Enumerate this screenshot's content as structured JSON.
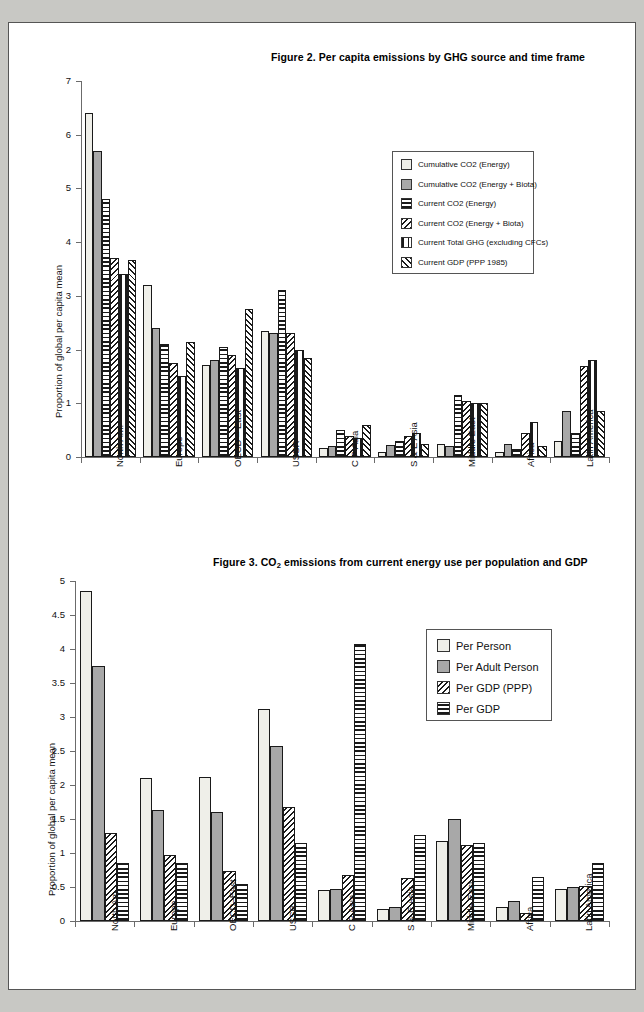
{
  "figures": [
    {
      "id": "figure-2",
      "title": "Figure 2. Per capita emissions by GHG source and time frame",
      "chart_data": {
        "type": "bar",
        "title": "Figure 2. Per capita emissions by GHG source and time frame",
        "xlabel": "",
        "ylabel": "Proportion of global per capita mean",
        "ylim": [
          0,
          7
        ],
        "yticks": [
          0,
          1,
          2,
          3,
          4,
          5,
          6,
          7
        ],
        "grid": false,
        "legend_position": "upper-right",
        "categories": [
          "North Am.",
          "Europe",
          "OECD – East",
          "USSR",
          "C P Asia",
          "S & E Asia",
          "Middle East",
          "Africa",
          "Latin America"
        ],
        "series": [
          {
            "name": "Cumulative CO2 (Energy)",
            "pattern": "dots",
            "values": [
              6.4,
              3.2,
              1.72,
              2.35,
              0.17,
              0.1,
              0.25,
              0.1,
              0.3
            ]
          },
          {
            "name": "Cumulative CO2 (Energy + Biota)",
            "pattern": "gray",
            "values": [
              5.7,
              2.4,
              1.8,
              2.3,
              0.2,
              0.22,
              0.2,
              0.25,
              0.85
            ]
          },
          {
            "name": "Current CO2  (Energy)",
            "pattern": "horizontal-lines",
            "values": [
              4.8,
              2.1,
              2.05,
              3.1,
              0.5,
              0.3,
              1.15,
              0.15,
              0.45
            ]
          },
          {
            "name": "Current CO2 (Energy + Biota)",
            "pattern": "back-diagonal",
            "values": [
              3.7,
              1.75,
              1.9,
              2.3,
              0.4,
              0.4,
              1.05,
              0.45,
              1.7
            ]
          },
          {
            "name": "Current Total GHG (excluding CFCs)",
            "pattern": "vertical-lines",
            "values": [
              3.4,
              1.5,
              1.65,
              2.0,
              0.35,
              0.45,
              1.0,
              0.65,
              1.8
            ]
          },
          {
            "name": "Current GDP (PPP 1985)",
            "pattern": "forward-diagonal",
            "values": [
              3.67,
              2.15,
              2.75,
              1.85,
              0.6,
              0.25,
              1.0,
              0.2,
              0.85
            ]
          }
        ]
      }
    },
    {
      "id": "figure-3",
      "title_prefix": "Figure 3. CO",
      "title_sub": "2",
      "title_suffix": " emissions from current energy use per population and GDP",
      "chart_data": {
        "type": "bar",
        "title": "Figure 3. CO2 emissions from current energy use per population and GDP",
        "xlabel": "",
        "ylabel": "Proportion of global per capita mean",
        "ylim": [
          0,
          5
        ],
        "yticks": [
          0,
          0.5,
          1,
          1.5,
          2,
          2.5,
          3,
          3.5,
          4,
          4.5,
          5
        ],
        "grid": false,
        "legend_position": "upper-right",
        "categories": [
          "North Am.",
          "Europe",
          "OECD–East",
          "USSR",
          "C P Asia",
          "S & E Asia",
          "Middle East",
          "Africa",
          "Latin America"
        ],
        "series": [
          {
            "name": "Per Person",
            "pattern": "dots",
            "values": [
              4.85,
              2.1,
              2.12,
              3.12,
              0.45,
              0.17,
              1.18,
              0.2,
              0.47
            ]
          },
          {
            "name": "Per Adult Person",
            "pattern": "gray",
            "values": [
              3.75,
              1.63,
              1.6,
              2.58,
              0.47,
              0.2,
              1.5,
              0.3,
              0.5
            ]
          },
          {
            "name": "Per GDP (PPP)",
            "pattern": "back-diagonal",
            "values": [
              1.3,
              0.97,
              0.73,
              1.67,
              0.67,
              0.63,
              1.12,
              0.12,
              0.52
            ]
          },
          {
            "name": "Per GDP",
            "pattern": "horizontal-lines",
            "values": [
              0.85,
              0.85,
              0.55,
              1.15,
              4.07,
              1.27,
              1.15,
              0.65,
              0.85
            ]
          }
        ]
      }
    }
  ]
}
